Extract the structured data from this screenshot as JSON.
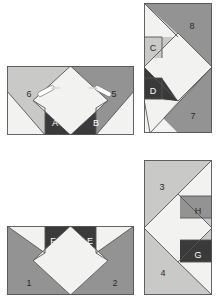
{
  "figure": {
    "background_color": "#ffffff"
  },
  "palette": {
    "white": "#f2f2f0",
    "light_gray": "#c9c9c7",
    "medium_gray": "#939393",
    "dark_gray": "#3a3a3a",
    "outline": "#555555",
    "label_dark": "#2a2a2a",
    "label_light": "#ffffff"
  },
  "panels": [
    {
      "id": "panel-top-left",
      "name": "top-left-unit",
      "x": 7,
      "y": 66,
      "width": 127,
      "height": 69,
      "labels": [
        {
          "key": "6",
          "text": "6",
          "x": 22,
          "y": 31,
          "tone": "dark"
        },
        {
          "key": "5",
          "text": "5",
          "x": 107,
          "y": 31,
          "tone": "dark"
        },
        {
          "key": "A",
          "text": "A",
          "x": 48,
          "y": 60,
          "tone": "light"
        },
        {
          "key": "B",
          "text": "B",
          "x": 89,
          "y": 60,
          "tone": "light"
        }
      ],
      "pins": [
        {
          "key": "pin-left",
          "cx": 39,
          "cy": 25,
          "angle": -28
        },
        {
          "key": "pin-right",
          "cx": 96,
          "cy": 25,
          "angle": 28
        }
      ]
    },
    {
      "id": "panel-top-right",
      "name": "top-right-unit",
      "x": 144,
      "y": 3,
      "width": 68,
      "height": 130,
      "labels": [
        {
          "key": "8",
          "text": "8",
          "x": 48,
          "y": 26,
          "tone": "dark"
        },
        {
          "key": "C",
          "text": "C",
          "x": 11,
          "y": 48,
          "tone": "dark"
        },
        {
          "key": "D",
          "text": "D",
          "x": 11,
          "y": 92,
          "tone": "light"
        },
        {
          "key": "7",
          "text": "7",
          "x": 49,
          "y": 116,
          "tone": "dark"
        }
      ],
      "pins": []
    },
    {
      "id": "panel-bottom-left",
      "name": "bottom-left-unit",
      "x": 7,
      "y": 226,
      "width": 127,
      "height": 69,
      "labels": [
        {
          "key": "1",
          "text": "1",
          "x": 22,
          "y": 60,
          "tone": "dark"
        },
        {
          "key": "2",
          "text": "2",
          "x": 108,
          "y": 60,
          "tone": "dark"
        },
        {
          "key": "F",
          "text": "F",
          "x": 45,
          "y": 18,
          "tone": "dark"
        },
        {
          "key": "E",
          "text": "E",
          "x": 89,
          "y": 18,
          "tone": "light"
        }
      ],
      "pins": []
    },
    {
      "id": "panel-bottom-right",
      "name": "bottom-right-unit",
      "x": 144,
      "y": 160,
      "width": 68,
      "height": 135,
      "labels": [
        {
          "key": "3",
          "text": "3",
          "x": 18,
          "y": 30,
          "tone": "dark"
        },
        {
          "key": "H",
          "text": "H",
          "x": 52,
          "y": 55,
          "tone": "dark"
        },
        {
          "key": "G",
          "text": "G",
          "x": 52,
          "y": 98,
          "tone": "light"
        },
        {
          "key": "4",
          "text": "4",
          "x": 19,
          "y": 116,
          "tone": "dark"
        }
      ],
      "pins": []
    }
  ]
}
